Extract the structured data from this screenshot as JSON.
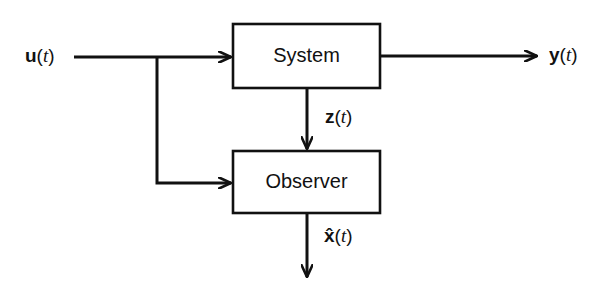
{
  "diagram": {
    "type": "block-diagram",
    "blocks": [
      {
        "id": "system",
        "label": "System"
      },
      {
        "id": "observer",
        "label": "Observer"
      }
    ],
    "signals": {
      "input": {
        "sym": "u",
        "arg": "t",
        "paren_open": "(",
        "paren_close": ")"
      },
      "output": {
        "sym": "y",
        "arg": "t",
        "paren_open": "(",
        "paren_close": ")"
      },
      "measurement": {
        "sym": "z",
        "arg": "t",
        "paren_open": "(",
        "paren_close": ")"
      },
      "estimate": {
        "sym": "x̂",
        "arg": "t",
        "paren_open": "(",
        "paren_close": ")"
      }
    },
    "connections": [
      {
        "from": "u(t)",
        "to": "system"
      },
      {
        "from": "u(t)",
        "to": "observer"
      },
      {
        "from": "system",
        "to": "y(t)"
      },
      {
        "from": "system",
        "to": "observer",
        "label": "z(t)"
      },
      {
        "from": "observer",
        "to": "x̂(t)"
      }
    ],
    "colors": {
      "stroke": "#111111",
      "background": "#ffffff"
    }
  }
}
